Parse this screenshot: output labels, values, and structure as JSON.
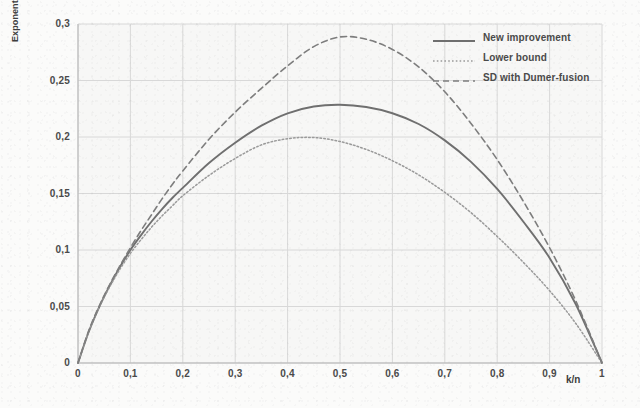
{
  "chart_data": {
    "type": "line",
    "title": "",
    "xlabel": "k/n",
    "ylabel": "Exponent complexity",
    "xlim": [
      0,
      1
    ],
    "ylim": [
      0,
      0.3
    ],
    "grid": true,
    "legend_position": "top-right",
    "x_ticks": [
      "0",
      "0,1",
      "0,2",
      "0,3",
      "0,4",
      "0,5",
      "0,6",
      "0,7",
      "0,8",
      "0,9",
      "1"
    ],
    "y_ticks": [
      "0",
      "0,05",
      "0,1",
      "0,15",
      "0,2",
      "0,25",
      "0,3"
    ],
    "x": [
      0,
      0.02,
      0.04,
      0.06,
      0.08,
      0.1,
      0.12,
      0.14,
      0.16,
      0.18,
      0.2,
      0.25,
      0.3,
      0.35,
      0.4,
      0.45,
      0.5,
      0.55,
      0.6,
      0.65,
      0.7,
      0.75,
      0.8,
      0.85,
      0.9,
      0.95,
      1.0
    ],
    "series": [
      {
        "name": "New improvement",
        "style": "solid",
        "color": "#6f6f6f",
        "values": [
          0,
          0.027,
          0.049,
          0.068,
          0.085,
          0.1,
          0.113,
          0.125,
          0.136,
          0.146,
          0.155,
          0.177,
          0.195,
          0.21,
          0.221,
          0.227,
          0.2285,
          0.2265,
          0.221,
          0.2115,
          0.197,
          0.178,
          0.154,
          0.125,
          0.093,
          0.052,
          0
        ]
      },
      {
        "name": "Lower bound",
        "style": "dotted",
        "color": "#9a9a9a",
        "values": [
          0,
          0.027,
          0.049,
          0.067,
          0.083,
          0.097,
          0.109,
          0.12,
          0.13,
          0.139,
          0.148,
          0.166,
          0.181,
          0.193,
          0.1985,
          0.1995,
          0.196,
          0.189,
          0.179,
          0.1665,
          0.151,
          0.133,
          0.112,
          0.089,
          0.064,
          0.035,
          0
        ]
      },
      {
        "name": "SD with Dumer-fusion",
        "style": "dashed",
        "color": "#7d7d7d",
        "values": [
          0,
          0.028,
          0.05,
          0.069,
          0.086,
          0.102,
          0.117,
          0.131,
          0.145,
          0.158,
          0.17,
          0.198,
          0.222,
          0.243,
          0.263,
          0.28,
          0.2885,
          0.2865,
          0.2775,
          0.262,
          0.24,
          0.212,
          0.18,
          0.143,
          0.102,
          0.055,
          0
        ]
      }
    ]
  },
  "axes": {
    "y_title": "Exponent complexity",
    "x_title": "k/n"
  },
  "legend": {
    "entries": [
      {
        "label": "New improvement",
        "style": "solid"
      },
      {
        "label": "Lower bound",
        "style": "dotted"
      },
      {
        "label": "SD with Dumer-fusion",
        "style": "dashed"
      }
    ]
  },
  "colors": {
    "plot_background": "#fbfbfa",
    "grid": "#d8d8d8",
    "axis": "#b9b9b9",
    "text": "#4a4a4a",
    "series_solid": "#6f6f6f",
    "series_dotted": "#9a9a9a",
    "series_dashed": "#7d7d7d"
  }
}
